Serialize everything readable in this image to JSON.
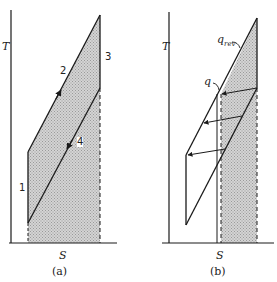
{
  "panels": [
    {
      "id": "a",
      "caption": "(a)",
      "y_axis_label": "T",
      "x_axis_label": "S",
      "point_labels": [
        "1",
        "2",
        "3",
        "4"
      ]
    },
    {
      "id": "b",
      "caption": "(b)",
      "y_axis_label": "T",
      "x_axis_label": "S",
      "curve_labels": {
        "q_rev_main": "q",
        "q_rev_sub": "rev",
        "q": "q"
      }
    }
  ],
  "colors": {
    "line": "#1a1a1a",
    "shade": "#c8c8c8"
  }
}
